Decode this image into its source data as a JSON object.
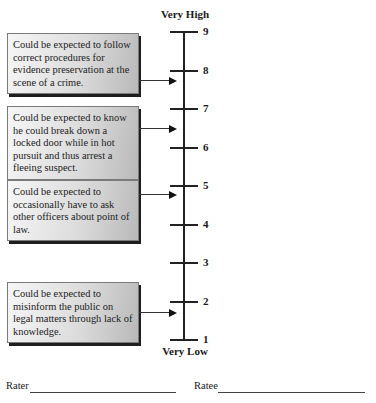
{
  "scale": {
    "top_label": "Very High",
    "bottom_label": "Very Low",
    "ticks": [
      {
        "value": "9",
        "y": 31
      },
      {
        "value": "8",
        "y": 70
      },
      {
        "value": "7",
        "y": 108
      },
      {
        "value": "6",
        "y": 147
      },
      {
        "value": "5",
        "y": 185
      },
      {
        "value": "4",
        "y": 224
      },
      {
        "value": "3",
        "y": 262
      },
      {
        "value": "2",
        "y": 301
      },
      {
        "value": "1",
        "y": 339
      }
    ]
  },
  "anchors": [
    {
      "text": "Could be expected to follow correct procedures for evidence preservation at the scene of a crime.",
      "points_to": 7.7
    },
    {
      "text": "Could be expected to know he could break down a locked door while in hot pursuit and thus arrest a fleeing suspect.",
      "points_to": 6.5
    },
    {
      "text": "Could be expected to occasionally have to ask other officers about point of law.",
      "points_to": 4.8
    },
    {
      "text": "Could be expected to misinform the public on legal matters through lack of knowledge.",
      "points_to": 1.7
    }
  ],
  "signatures": {
    "rater_label": "Rater",
    "ratee_label": "Ratee"
  }
}
